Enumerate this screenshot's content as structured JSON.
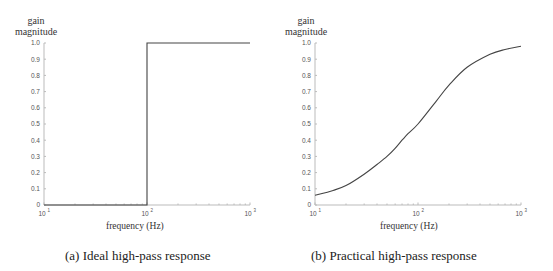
{
  "chart_data": [
    {
      "type": "line",
      "title": "(a)  Ideal high-pass response",
      "ylabel": "gain magnitude",
      "xlabel": "frequency (Hz)",
      "xscale": "log",
      "xlim": [
        10,
        1000
      ],
      "ylim": [
        0,
        1.0
      ],
      "x_ticks": [
        "10^1",
        "10^2",
        "10^3"
      ],
      "y_ticks": [
        "0",
        "0.1",
        "0.2",
        "0.3",
        "0.4",
        "0.5",
        "0.6",
        "0.7",
        "0.8",
        "0.9",
        "1.0"
      ],
      "grid": false,
      "series": [
        {
          "name": "ideal",
          "x": [
            10,
            100,
            100,
            1000
          ],
          "y": [
            0,
            0,
            1.0,
            1.0
          ]
        }
      ]
    },
    {
      "type": "line",
      "title": "(b)  Practical high-pass response",
      "ylabel": "gain magnitude",
      "xlabel": "frequency (Hz)",
      "xscale": "log",
      "xlim": [
        10,
        1000
      ],
      "ylim": [
        0,
        1.0
      ],
      "x_ticks": [
        "10^1",
        "10^2",
        "10^3"
      ],
      "y_ticks": [
        "0",
        "0.1",
        "0.2",
        "0.3",
        "0.4",
        "0.5",
        "0.6",
        "0.7",
        "0.8",
        "0.9",
        "1.0"
      ],
      "grid": false,
      "series": [
        {
          "name": "practical",
          "x": [
            10,
            15,
            20,
            30,
            40,
            50,
            60,
            70,
            80,
            100,
            150,
            200,
            300,
            500,
            700,
            1000
          ],
          "y": [
            0.06,
            0.09,
            0.12,
            0.19,
            0.25,
            0.3,
            0.35,
            0.4,
            0.44,
            0.5,
            0.64,
            0.74,
            0.85,
            0.93,
            0.96,
            0.98
          ]
        }
      ]
    }
  ],
  "panel_a": {
    "ylabel_line1": "gain",
    "ylabel_line2": "magnitude",
    "xlabel": "frequency (Hz)",
    "caption": "(a)  Ideal high-pass response"
  },
  "panel_b": {
    "ylabel_line1": "gain",
    "ylabel_line2": "magnitude",
    "caption": "(b)  Practical high-pass response"
  }
}
